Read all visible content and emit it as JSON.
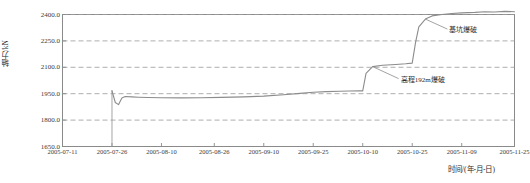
{
  "chart_data": {
    "type": "line",
    "title": "",
    "xlabel": "时间/(年-月-日)",
    "ylabel": "轴力/kN",
    "ylim": [
      1650.0,
      2400.0
    ],
    "yticks": [
      "2400.0",
      "2250.0",
      "2100.0",
      "1950.0",
      "1800.0",
      "1650.0"
    ],
    "ytick_values": [
      2400.0,
      2250.0,
      2100.0,
      1950.0,
      1800.0,
      1650.0
    ],
    "xticks": [
      "2005-07-11",
      "2005-07-26",
      "2005-08-10",
      "2005-08-26",
      "2005-09-10",
      "2005-09-25",
      "2005-10-10",
      "2005-10-25",
      "2005-11-09",
      "2005-11-25"
    ],
    "grid": "horizontal-dashed",
    "legend": "none",
    "line_color": "#8c8c8c",
    "series": [
      {
        "name": "轴力",
        "x": [
          "2005-07-26",
          "2005-07-26",
          "2005-07-27",
          "2005-07-28",
          "2005-07-29",
          "2005-07-30",
          "2005-08-01",
          "2005-08-03",
          "2005-08-06",
          "2005-08-10",
          "2005-08-16",
          "2005-08-22",
          "2005-08-28",
          "2005-09-04",
          "2005-09-10",
          "2005-09-16",
          "2005-09-21",
          "2005-09-25",
          "2005-09-29",
          "2005-10-03",
          "2005-10-06",
          "2005-10-09",
          "2005-10-10",
          "2005-10-11",
          "2005-10-13",
          "2005-10-16",
          "2005-10-20",
          "2005-10-23",
          "2005-10-25",
          "2005-10-26",
          "2005-10-27",
          "2005-10-29",
          "2005-10-31",
          "2005-11-03",
          "2005-11-06",
          "2005-11-09",
          "2005-11-13",
          "2005-11-16",
          "2005-11-19",
          "2005-11-22",
          "2005-11-25"
        ],
        "y": [
          1968,
          1966,
          1900,
          1888,
          1926,
          1934,
          1932,
          1930,
          1928,
          1927,
          1926,
          1927,
          1929,
          1932,
          1936,
          1944,
          1952,
          1958,
          1962,
          1964,
          1965,
          1966,
          1966,
          2066,
          2104,
          2112,
          2116,
          2120,
          2124,
          2240,
          2330,
          2374,
          2392,
          2400,
          2406,
          2409,
          2412,
          2416,
          2414,
          2418,
          2416
        ]
      }
    ],
    "event_marker": {
      "name": "drop-line",
      "x": "2005-07-26",
      "y_top": 1968,
      "y_bottom": 1650
    },
    "annotations": [
      {
        "id": "annot-1",
        "text": "基坑爆破",
        "points_to_x": "2005-10-29",
        "points_to_y": 2374
      },
      {
        "id": "annot-2",
        "text": "高程192m爆破",
        "points_to_x": "2005-10-13",
        "points_to_y": 2104
      }
    ]
  }
}
